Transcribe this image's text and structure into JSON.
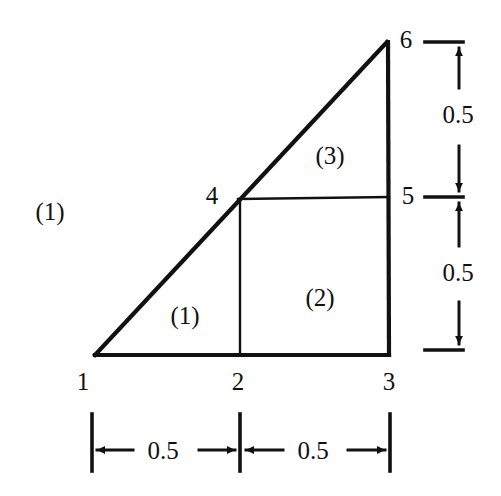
{
  "figure": {
    "ink_color": "#111111",
    "background_color": "#ffffff"
  },
  "nodes": [
    {
      "id": "1",
      "label": "1",
      "x": 95,
      "y": 355,
      "label_x": 83,
      "label_y": 381
    },
    {
      "id": "2",
      "label": "2",
      "x": 240,
      "y": 355,
      "label_x": 238,
      "label_y": 381
    },
    {
      "id": "3",
      "label": "3",
      "x": 389,
      "y": 355,
      "label_x": 389,
      "label_y": 381
    },
    {
      "id": "4",
      "label": "4",
      "x": 240,
      "y": 199,
      "label_x": 212,
      "label_y": 195
    },
    {
      "id": "5",
      "label": "5",
      "x": 388,
      "y": 197,
      "label_x": 408,
      "label_y": 195
    },
    {
      "id": "6",
      "label": "6",
      "x": 387,
      "y": 42,
      "label_x": 406,
      "label_y": 39
    }
  ],
  "elements": [
    {
      "label": "(1)",
      "x": 185,
      "y": 315,
      "nodes": [
        "1",
        "2",
        "4"
      ]
    },
    {
      "label": "(2)",
      "x": 320,
      "y": 297,
      "nodes": [
        "2",
        "3",
        "5",
        "4"
      ]
    },
    {
      "label": "(3)",
      "x": 330,
      "y": 155,
      "nodes": [
        "4",
        "5",
        "6"
      ]
    }
  ],
  "body_label": {
    "label": "(1)",
    "x": 50,
    "y": 211
  },
  "dimensions": {
    "vertical": [
      {
        "label": "0.5",
        "x": 458,
        "y": 114,
        "from_y": 42,
        "to_y": 197
      },
      {
        "label": "0.5",
        "x": 458,
        "y": 272,
        "from_y": 197,
        "to_y": 350
      }
    ],
    "horizontal": [
      {
        "label": "0.5",
        "x": 163,
        "y": 450,
        "from_x": 92,
        "to_x": 240
      },
      {
        "label": "0.5",
        "x": 313,
        "y": 450,
        "from_x": 240,
        "to_x": 390
      }
    ]
  }
}
